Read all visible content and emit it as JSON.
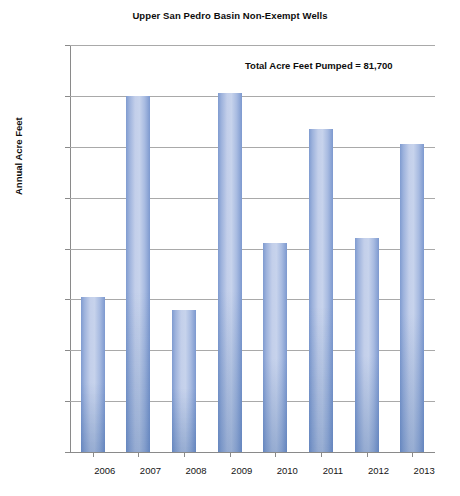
{
  "chart_data": {
    "type": "bar",
    "title": "Upper San Pedro Basin Non-Exempt Wells",
    "xlabel": "",
    "ylabel": "Annual Acre Feet",
    "categories": [
      "2006",
      "2007",
      "2008",
      "2009",
      "2010",
      "2011",
      "2012",
      "2013"
    ],
    "values": [
      9810,
      10600,
      9760,
      10610,
      10020,
      10470,
      10040,
      10410
    ],
    "ylim": [
      9200,
      10800
    ],
    "ytick_labels": [
      "10800",
      "10600",
      "10400",
      "10200",
      "10000",
      "9800",
      "9600",
      "9400",
      "9200"
    ],
    "ytick_values": [
      10800,
      10600,
      10400,
      10200,
      10000,
      9800,
      9600,
      9400,
      9200
    ],
    "grid": true,
    "legend": "none",
    "annotations": [
      {
        "name": "total-pumped",
        "text": "Total Acre Feet Pumped = 81,700"
      }
    ],
    "colors": {
      "bar_light": "#c7d3ec",
      "bar_mid": "#9db2dc",
      "bar_edge": "#7d99cf",
      "bar_base": "#4a6fa8",
      "grid": "#a9a9a9",
      "axis": "#8a8a8a",
      "text": "#141414",
      "background": "#ffffff"
    }
  }
}
